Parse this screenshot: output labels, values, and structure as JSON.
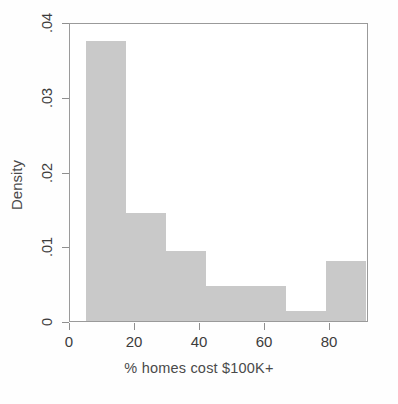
{
  "chart_data": {
    "type": "bar",
    "chart_subtype": "histogram",
    "title": "",
    "xlabel": "% homes cost $100K+",
    "ylabel": "Density",
    "xlim": [
      0,
      92
    ],
    "ylim": [
      0,
      0.04
    ],
    "grid": false,
    "legend": null,
    "bar_color": "#c9c9c9",
    "axis_color": "#8f8f8f",
    "xticks": [
      0,
      20,
      40,
      60,
      80
    ],
    "xtick_labels": [
      "0",
      "20",
      "40",
      "60",
      "80"
    ],
    "yticks": [
      0,
      0.01,
      0.02,
      0.03,
      0.04
    ],
    "ytick_labels": [
      "0",
      ".01",
      ".02",
      ".03",
      ".04"
    ],
    "bins": [
      {
        "x0": 5.0,
        "x1": 17.3,
        "density": 0.0375
      },
      {
        "x0": 17.3,
        "x1": 29.6,
        "density": 0.0145
      },
      {
        "x0": 29.6,
        "x1": 41.9,
        "density": 0.0094
      },
      {
        "x0": 41.9,
        "x1": 54.2,
        "density": 0.0047
      },
      {
        "x0": 54.2,
        "x1": 66.5,
        "density": 0.0047
      },
      {
        "x0": 66.5,
        "x1": 78.8,
        "density": 0.0013
      },
      {
        "x0": 78.8,
        "x1": 91.1,
        "density": 0.008
      }
    ]
  }
}
